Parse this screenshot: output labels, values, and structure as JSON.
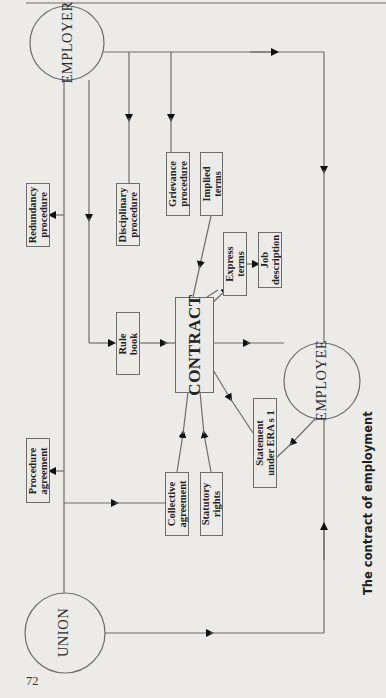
{
  "page": {
    "page_number": "72",
    "running_title": "The contract of employment"
  },
  "colors": {
    "background": "#ecebe8",
    "line": "#6d6d6d",
    "text": "#1a1a1a"
  },
  "diagram": {
    "title": "The contract of employment",
    "parties": {
      "employer": "EMPLOYER",
      "employee": "EMPLOYEE",
      "union": "UNION"
    },
    "nodes": {
      "contract": "CONTRACT",
      "redundancy_procedure": "Redundancy\nprocedure",
      "disciplinary_procedure": "Disciplinary\nprocedure",
      "grievance_procedure": "Grievance\nprocedure",
      "implied_terms": "Implied\nterms",
      "express_terms": "Express\nterms",
      "job_description": "Job\ndescription",
      "rule_book": "Rule\nbook",
      "statement_under_era": "Statement\nunder ERA s 1",
      "procedure_agreement": "Procedure\nagreement",
      "collective_agreement": "Collective\nagreement",
      "statutory_rights": "Statutory\nrights"
    },
    "edges": [
      {
        "from": "EMPLOYER",
        "to": "Redundancy procedure"
      },
      {
        "from": "EMPLOYER",
        "to": "Rule book"
      },
      {
        "from": "EMPLOYER",
        "to": "Disciplinary procedure"
      },
      {
        "from": "EMPLOYER",
        "to": "Grievance procedure"
      },
      {
        "from": "EMPLOYER",
        "to": "EMPLOYEE"
      },
      {
        "from": "Implied terms",
        "to": "CONTRACT"
      },
      {
        "from": "CONTRACT",
        "to": "Express terms"
      },
      {
        "from": "Express terms",
        "to": "Job description"
      },
      {
        "from": "Rule book",
        "to": "CONTRACT"
      },
      {
        "from": "CONTRACT",
        "to": "EMPLOYEE"
      },
      {
        "from": "CONTRACT",
        "to": "Statement under ERA s 1"
      },
      {
        "from": "EMPLOYEE",
        "to": "Statement under ERA s 1"
      },
      {
        "from": "UNION",
        "to": "Procedure agreement"
      },
      {
        "from": "UNION",
        "to": "Collective agreement"
      },
      {
        "from": "Collective agreement",
        "to": "CONTRACT"
      },
      {
        "from": "Statutory rights",
        "to": "CONTRACT"
      },
      {
        "from": "UNION",
        "to": "EMPLOYEE"
      }
    ]
  }
}
